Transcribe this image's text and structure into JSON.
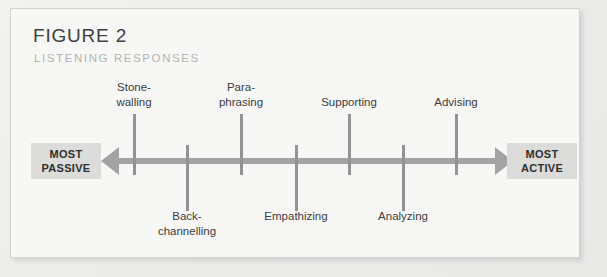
{
  "figure": {
    "title": "FIGURE 2",
    "subtitle": "LISTENING RESPONSES"
  },
  "endcaps": {
    "left": "MOST\nPASSIVE",
    "right": "MOST\nACTIVE"
  },
  "colors": {
    "card_background": "#f7f7f6",
    "card_border": "#d2d2d0",
    "axis": "#a3a3a3",
    "tick": "#939393",
    "endcap_background": "#dcdcda",
    "title_text": "#404040",
    "subtitle_text": "#b3b3b1",
    "label_text": "#3c3c3c"
  },
  "chart_data": {
    "type": "diagram",
    "title": "FIGURE 2",
    "subtitle": "LISTENING RESPONSES",
    "axis_orientation": "horizontal",
    "axis_type": "double-headed-arrow",
    "axis_left_label": "MOST PASSIVE",
    "axis_right_label": "MOST ACTIVE",
    "axis_range_px": [
      100,
      512
    ],
    "grid": false,
    "legend": "none",
    "categories": [
      "Stone-walling",
      "Back-channelling",
      "Para-phrasing",
      "Empathizing",
      "Supporting",
      "Analyzing",
      "Advising"
    ],
    "values": [
      1,
      2,
      3,
      4,
      5,
      6,
      7
    ],
    "nodes": [
      {
        "label": "Stone-\nwalling",
        "x": 133,
        "side": "above",
        "rank": 1
      },
      {
        "label": "Back-\nchannelling",
        "x": 186,
        "side": "below",
        "rank": 2
      },
      {
        "label": "Para-\nphrasing",
        "x": 240,
        "side": "above",
        "rank": 3
      },
      {
        "label": "Empathizing",
        "x": 295,
        "side": "below",
        "rank": 4
      },
      {
        "label": "Supporting",
        "x": 348,
        "side": "above",
        "rank": 5
      },
      {
        "label": "Analyzing",
        "x": 402,
        "side": "below",
        "rank": 6
      },
      {
        "label": "Advising",
        "x": 455,
        "side": "above",
        "rank": 7
      }
    ]
  }
}
